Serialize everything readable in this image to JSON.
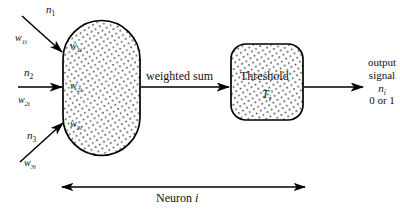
{
  "diagram": {
    "stroke_color": "#000000",
    "fill_color": "#ffffff",
    "stipple_color": "#3a3a3a",
    "inputs": [
      {
        "signal_base": "n",
        "signal_sub": "1",
        "weight_base": "w",
        "weight_sub": "1i",
        "inner_base": "w",
        "inner_sub": "1i"
      },
      {
        "signal_base": "n",
        "signal_sub": "2",
        "weight_base": "w",
        "weight_sub": "2i",
        "inner_base": "w",
        "inner_sub": "2i"
      },
      {
        "signal_base": "n",
        "signal_sub": "3",
        "weight_base": "w",
        "weight_sub": "3i",
        "inner_base": "w",
        "inner_sub": "3i"
      }
    ],
    "middle_arrow_label": "weighted sum",
    "threshold": {
      "label": "Threshold",
      "symbol_base": "T",
      "symbol_sub": "i"
    },
    "output": {
      "line1": "output",
      "line2": "signal",
      "symbol_base": "n",
      "symbol_sub": "i",
      "line4": "0 or 1"
    },
    "span_label_base": "Neuron ",
    "span_label_italic": "i"
  }
}
